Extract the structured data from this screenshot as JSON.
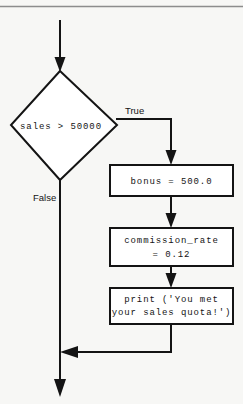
{
  "diagram": {
    "type": "flowchart",
    "colors": {
      "background": "#f7f7f5",
      "stroke": "#141414",
      "node_fill": "#ffffff",
      "rule": "#8d8d8d"
    },
    "decision": {
      "label": "sales > 50000",
      "shape": "diamond",
      "true_label": "True",
      "false_label": "False"
    },
    "process_boxes": [
      {
        "id": "bonus-box",
        "lines": [
          "bonus = 500.0"
        ]
      },
      {
        "id": "commission-box",
        "lines": [
          "commission_rate",
          "= 0.12"
        ]
      },
      {
        "id": "print-box",
        "lines": [
          "print ('You met",
          "your sales quota!')"
        ]
      }
    ],
    "connectors": {
      "entry_arrow": "down into decision",
      "true_branch": "right then down into bonus box",
      "false_branch": "down past boxes to exit",
      "merge_arrow": "left into false branch",
      "exit_arrow": "down out of diagram"
    }
  }
}
